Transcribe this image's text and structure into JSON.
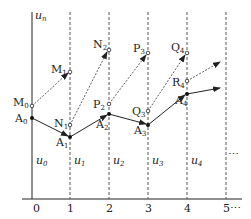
{
  "diagram": {
    "axis_label": "u",
    "axis_label_sub": "n",
    "x_ticks": [
      "0",
      "1",
      "2",
      "3",
      "4",
      "5⋯"
    ],
    "ellipsis": "⋯",
    "column_labels": [
      {
        "base": "u",
        "sub": "0"
      },
      {
        "base": "u",
        "sub": "1"
      },
      {
        "base": "u",
        "sub": "2"
      },
      {
        "base": "u",
        "sub": "3"
      },
      {
        "base": "u",
        "sub": "4"
      }
    ],
    "points": {
      "M0": {
        "base": "M",
        "sub": "0"
      },
      "A0": {
        "base": "A",
        "sub": "0"
      },
      "M1": {
        "base": "M",
        "sub": "1"
      },
      "N1": {
        "base": "N",
        "sub": "1"
      },
      "A1": {
        "base": "A",
        "sub": "1"
      },
      "N2": {
        "base": "N",
        "sub": "2"
      },
      "P2": {
        "base": "P",
        "sub": "2"
      },
      "A2": {
        "base": "A",
        "sub": "2"
      },
      "P3": {
        "base": "P",
        "sub": "3"
      },
      "Q3": {
        "base": "Q",
        "sub": "3"
      },
      "A3": {
        "base": "A",
        "sub": "3"
      },
      "Q4": {
        "base": "Q",
        "sub": "4"
      },
      "R4": {
        "base": "R",
        "sub": "4"
      },
      "A4": {
        "base": "A",
        "sub": "4"
      }
    },
    "colors": {
      "line": "#222222",
      "dashed": "#555555"
    }
  }
}
